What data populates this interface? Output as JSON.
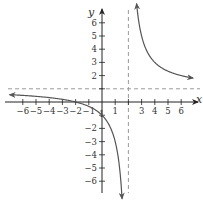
{
  "chart_data": {
    "type": "line",
    "title": "",
    "function": "y = (x + 2) / (x - 2)",
    "function_form": {
      "a": 1,
      "k": 4,
      "h": 2
    },
    "xlabel": "x",
    "ylabel": "y",
    "xlim": [
      -7.3,
      7.2
    ],
    "ylim": [
      -6.8,
      6.9
    ],
    "grid": false,
    "x_ticks": [
      -6,
      -5,
      -4,
      -3,
      -2,
      -1,
      1,
      3,
      4,
      5,
      6
    ],
    "x_tick_labels": [
      "−6",
      "−5",
      "−4",
      "−3",
      "−2",
      "−1",
      "1",
      "3",
      "4",
      "5",
      "6"
    ],
    "x_tick_marks": [
      -6,
      -5,
      -4,
      -3,
      -2,
      -1,
      1,
      2,
      3,
      4,
      5,
      6
    ],
    "y_ticks": [
      6,
      5,
      4,
      3,
      2,
      -2,
      -3,
      -4,
      -5,
      -6
    ],
    "y_tick_labels": [
      "6",
      "5",
      "4",
      "3",
      "2",
      "−2",
      "−3",
      "−4",
      "−5",
      "−6"
    ],
    "y_tick_marks": [
      6,
      5,
      4,
      3,
      2,
      1,
      -1,
      -2,
      -3,
      -4,
      -5,
      -6
    ],
    "y_minus1_label": "1",
    "asymptotes": {
      "vertical": {
        "x": 2,
        "style": "dashed"
      },
      "horizontal": {
        "y": 1,
        "style": "dashed"
      }
    },
    "series": [
      {
        "name": "left branch",
        "x_range": [
          -7.0,
          1.52
        ],
        "points": [
          [
            -7.0,
            0.56
          ],
          [
            -6,
            0.5
          ],
          [
            -4,
            0.33
          ],
          [
            -2,
            0
          ],
          [
            -1,
            -0.33
          ],
          [
            0,
            -1
          ],
          [
            1,
            -3
          ],
          [
            1.52,
            -7.3
          ]
        ]
      },
      {
        "name": "right branch",
        "x_range": [
          2.62,
          6.9
        ],
        "points": [
          [
            2.62,
            7.3
          ],
          [
            3,
            5
          ],
          [
            4,
            3
          ],
          [
            5,
            2.33
          ],
          [
            6,
            2
          ],
          [
            6.9,
            1.82
          ]
        ]
      }
    ],
    "colors": {
      "curve": "#555555",
      "axes": "#222222",
      "asymptote": "#9a9a9a",
      "text": "#333333"
    }
  }
}
